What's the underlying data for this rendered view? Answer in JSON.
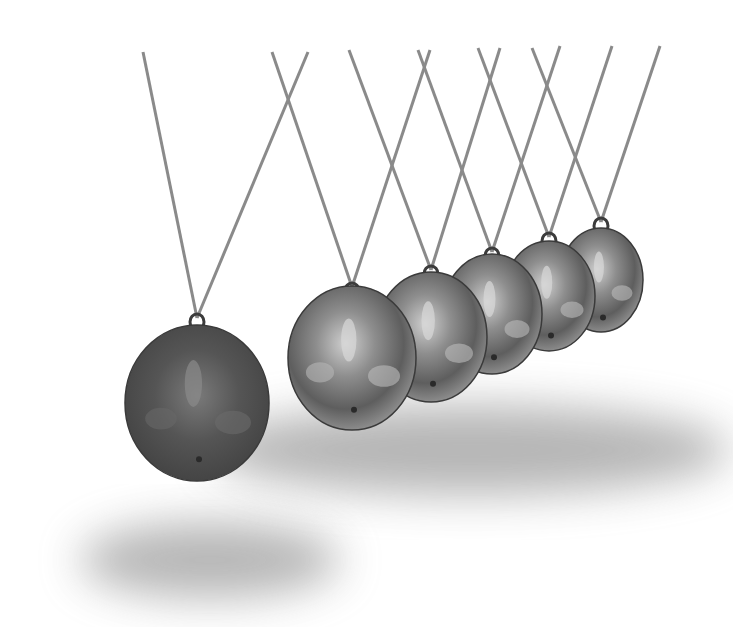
{
  "image": {
    "subject": "Newton's cradle",
    "description": "Six chrome pendulum balls on crossed strings; leftmost ball swung out and darker, five balls resting in a receding row",
    "width": 733,
    "height": 627,
    "background": "#ffffff"
  },
  "colors": {
    "string": "#8a8a8a",
    "shadow": "#7a7a7a",
    "ball_dark": "#4a4a4a",
    "ball_mid": "#7d7d7d",
    "ball_light": "#d8d8d8",
    "ball_edge": "#3a3a3a",
    "hook": "#3c3c3c"
  },
  "balls": [
    {
      "name": "ball-swinging",
      "cx": 197,
      "cy": 403,
      "rx": 72,
      "ry": 78,
      "dark": true,
      "top": [
        143,
        52
      ],
      "top2": [
        308,
        52
      ],
      "hook_y": 318
    },
    {
      "name": "ball-1",
      "cx": 352,
      "cy": 358,
      "rx": 64,
      "ry": 72,
      "dark": false,
      "top": [
        272,
        52
      ],
      "top2": [
        430,
        50
      ],
      "hook_y": 287
    },
    {
      "name": "ball-2",
      "cx": 431,
      "cy": 337,
      "rx": 56,
      "ry": 65,
      "dark": false,
      "top": [
        349,
        50
      ],
      "top2": [
        500,
        48
      ],
      "hook_y": 270
    },
    {
      "name": "ball-3",
      "cx": 492,
      "cy": 314,
      "rx": 50,
      "ry": 60,
      "dark": false,
      "top": [
        418,
        50
      ],
      "top2": [
        560,
        46
      ],
      "hook_y": 252
    },
    {
      "name": "ball-4",
      "cx": 549,
      "cy": 296,
      "rx": 46,
      "ry": 55,
      "dark": false,
      "top": [
        478,
        48
      ],
      "top2": [
        612,
        46
      ],
      "hook_y": 237
    },
    {
      "name": "ball-5",
      "cx": 601,
      "cy": 280,
      "rx": 42,
      "ry": 52,
      "dark": false,
      "top": [
        532,
        48
      ],
      "top2": [
        660,
        46
      ],
      "hook_y": 222
    }
  ],
  "shadows": [
    {
      "name": "shadow-swinging",
      "cx": 210,
      "cy": 560,
      "rx": 130,
      "ry": 38
    },
    {
      "name": "shadow-row",
      "cx": 470,
      "cy": 450,
      "rx": 260,
      "ry": 45
    }
  ]
}
